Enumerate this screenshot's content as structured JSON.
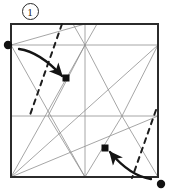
{
  "figure": {
    "kind": "origami-crease-pattern-step",
    "step_label": "1",
    "caption": "",
    "colors": {
      "paper_edge": "#2b2b2b",
      "crease_line": "#8c8c8c",
      "fold_line_dashed": "#1e1e1e",
      "arrow": "#141414",
      "dot": "#111111",
      "background": "#ffffff"
    },
    "square": {
      "left": 11,
      "top": 24,
      "right": 158,
      "bottom": 177
    },
    "reference_dots": [
      {
        "name": "left-edge-reference-dot",
        "x": 8,
        "y": 45,
        "r": 4
      },
      {
        "name": "bottom-right-reference-dot",
        "x": 161,
        "y": 184,
        "r": 4
      }
    ],
    "target_dots": [
      {
        "name": "upper-target-dot",
        "x": 66,
        "y": 78,
        "size": 7
      },
      {
        "name": "lower-target-dot",
        "x": 105,
        "y": 148,
        "size": 7
      }
    ],
    "fold_lines": [
      {
        "name": "upper-left-valley-fold",
        "x1": 62,
        "y1": 24,
        "x2": 30,
        "y2": 115
      },
      {
        "name": "lower-right-valley-fold",
        "x1": 156,
        "y1": 110,
        "x2": 132,
        "y2": 178
      }
    ],
    "arrows": [
      {
        "name": "upper-fold-arrow",
        "from_x": 20,
        "from_y": 50,
        "to_x": 64,
        "to_y": 77
      },
      {
        "name": "lower-fold-arrow",
        "from_x": 150,
        "from_y": 178,
        "to_x": 108,
        "to_y": 152
      }
    ],
    "crease_lines": [
      {
        "name": "horizontal-crease-upper",
        "x1": 11,
        "y1": 45,
        "x2": 158,
        "y2": 45
      },
      {
        "name": "horizontal-crease-middle",
        "x1": 11,
        "y1": 116,
        "x2": 158,
        "y2": 116
      },
      {
        "name": "vertical-crease-center",
        "x1": 85,
        "y1": 24,
        "x2": 85,
        "y2": 177
      },
      {
        "name": "diagonal-bl-to-topcenter",
        "x1": 11,
        "y1": 177,
        "x2": 85,
        "y2": 45
      },
      {
        "name": "diagonal-bl-to-rightmid",
        "x1": 11,
        "y1": 177,
        "x2": 158,
        "y2": 116
      },
      {
        "name": "diagonal-bl-to-topright",
        "x1": 11,
        "y1": 177,
        "x2": 158,
        "y2": 45
      },
      {
        "name": "diagonal-topcenter-to-bottomcenter-left",
        "x1": 85,
        "y1": 45,
        "x2": 11,
        "y2": 177
      },
      {
        "name": "diagonal-leftmid-to-topcenter",
        "x1": 11,
        "y1": 45,
        "x2": 85,
        "y2": 24
      },
      {
        "name": "vee-left-top",
        "x1": 85,
        "y1": 45,
        "x2": 73,
        "y2": 24
      },
      {
        "name": "vee-right-top",
        "x1": 85,
        "y1": 45,
        "x2": 97,
        "y2": 24
      },
      {
        "name": "vee-left-down",
        "x1": 85,
        "y1": 45,
        "x2": 48,
        "y2": 116
      },
      {
        "name": "vee-right-down",
        "x1": 85,
        "y1": 45,
        "x2": 122,
        "y2": 116
      },
      {
        "name": "lower-vee-left",
        "x1": 122,
        "y1": 116,
        "x2": 85,
        "y2": 177
      },
      {
        "name": "lower-vee-left-2",
        "x1": 48,
        "y1": 116,
        "x2": 85,
        "y2": 177
      },
      {
        "name": "lower-vee-right",
        "x1": 122,
        "y1": 116,
        "x2": 158,
        "y2": 177
      },
      {
        "name": "diagonal-rightmid-up-to-topright",
        "x1": 122,
        "y1": 116,
        "x2": 158,
        "y2": 45
      },
      {
        "name": "left-lower-diagonal",
        "x1": 11,
        "y1": 45,
        "x2": 85,
        "y2": 177
      }
    ]
  }
}
